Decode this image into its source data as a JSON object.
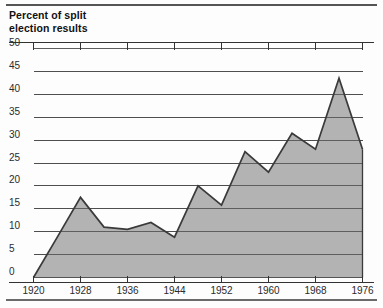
{
  "title_line1": "Percent of split",
  "title_line2": "election results",
  "colors": {
    "area_fill": "#a9a9a9",
    "line": "#3a3a3a",
    "grid": "#4a4a4a",
    "axis": "#333333",
    "text": "#2b2b2b",
    "rule": "#555555",
    "background": "#fdfdfd"
  },
  "chart_data": {
    "type": "area",
    "title": "Percent of split election results",
    "xlabel": "",
    "ylabel": "Percent of split election results",
    "x": [
      1920,
      1924,
      1928,
      1932,
      1936,
      1940,
      1944,
      1948,
      1952,
      1956,
      1960,
      1964,
      1968,
      1972,
      1976
    ],
    "values": [
      0.0,
      8.7,
      17.5,
      11.0,
      10.5,
      12.0,
      8.8,
      20.0,
      15.8,
      27.5,
      23.0,
      31.5,
      28.0,
      43.5,
      28.0
    ],
    "xlim": [
      1920,
      1976
    ],
    "ylim": [
      0,
      50
    ],
    "ytick_values": [
      0,
      5,
      10,
      15,
      20,
      25,
      30,
      35,
      40,
      45,
      50
    ],
    "ytick_labels": [
      "0",
      "5",
      "10",
      "15",
      "20",
      "25",
      "30",
      "35",
      "40",
      "45",
      "50"
    ],
    "xtick_values": [
      1920,
      1928,
      1936,
      1944,
      1952,
      1960,
      1968,
      1976
    ],
    "xtick_labels": [
      "1920",
      "1928",
      "1936",
      "1944",
      "1952",
      "1960",
      "1968",
      "1976"
    ],
    "grid": true,
    "grid_axis": "y",
    "legend": false,
    "series": [
      {
        "name": "Percent of split election results",
        "values": [
          0.0,
          8.7,
          17.5,
          11.0,
          10.5,
          12.0,
          8.8,
          20.0,
          15.8,
          27.5,
          23.0,
          31.5,
          28.0,
          43.5,
          28.0
        ]
      }
    ]
  }
}
